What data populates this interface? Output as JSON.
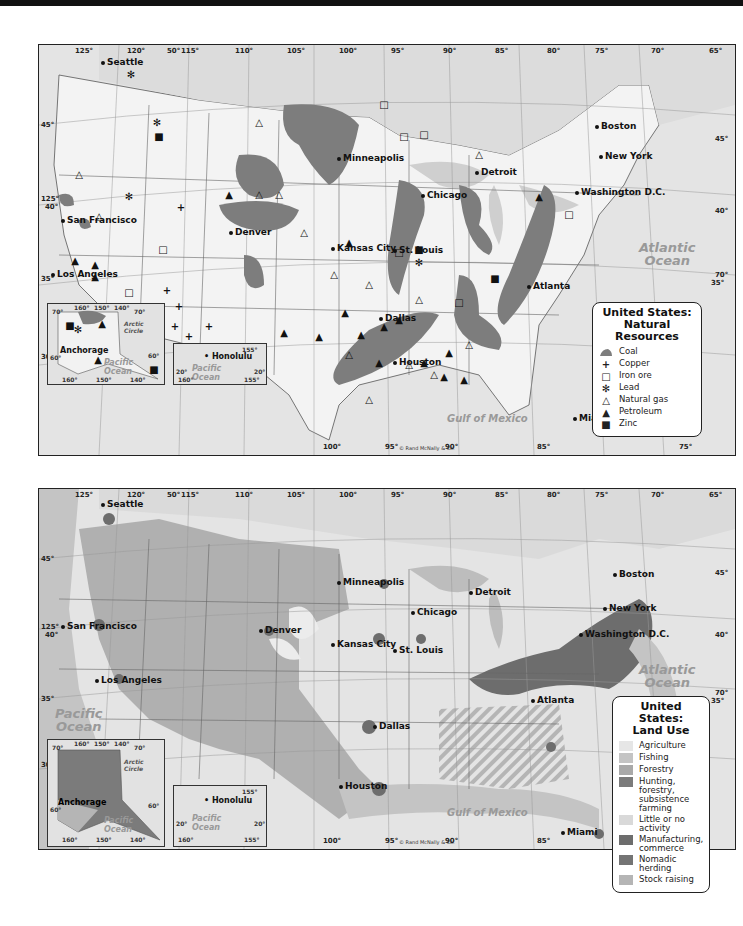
{
  "maps": [
    {
      "id": "natural-resources",
      "legend": {
        "title_line1": "United States:",
        "title_line2": "Natural Resources",
        "items": [
          {
            "symbol": "coal-shape",
            "label": "Coal"
          },
          {
            "symbol": "+",
            "label": "Copper"
          },
          {
            "symbol": "□",
            "label": "Iron ore"
          },
          {
            "symbol": "✻",
            "label": "Lead"
          },
          {
            "symbol": "△",
            "label": "Natural gas"
          },
          {
            "symbol": "▲",
            "label": "Petroleum"
          },
          {
            "symbol": "■",
            "label": "Zinc"
          }
        ]
      },
      "colors": {
        "coal": "#7d7d7d",
        "land": "#f0f0f0",
        "water": "#d3d3d3"
      }
    },
    {
      "id": "land-use",
      "legend": {
        "title_line1": "United States:",
        "title_line2": "Land Use",
        "items": [
          {
            "label": "Agriculture",
            "color": "#e6e6e6"
          },
          {
            "label": "Fishing",
            "color": "#c4c4c4"
          },
          {
            "label": "Forestry",
            "color": "#a9a9a9"
          },
          {
            "label": "Hunting, forestry, subsistence farming",
            "color": "#7b7b7b"
          },
          {
            "label": "Little or no activity",
            "color": "#d9d9d9"
          },
          {
            "label": "Manufacturing, commerce",
            "color": "#6d6d6d"
          },
          {
            "label": "Nomadic herding",
            "color": "#747474"
          },
          {
            "label": "Stock raising",
            "color": "#b5b5b5"
          }
        ]
      }
    }
  ],
  "longitude_labels": [
    "125°",
    "120°",
    "115°",
    "110°",
    "105°",
    "100°",
    "95°",
    "90°",
    "85°",
    "80°",
    "75°",
    "70°",
    "65°"
  ],
  "bottom_longitudes": [
    "100°",
    "95°",
    "90°",
    "85°",
    "75°"
  ],
  "latitude_labels": [
    "45°",
    "40°",
    "35°",
    "30°"
  ],
  "extra_labels": {
    "lat50": "50°",
    "lon125": "125°",
    "lat40r": "40°",
    "lon70r": "70°",
    "lat35r": "35°",
    "lat45r": "45°"
  },
  "cities": [
    "Seattle",
    "San Francisco",
    "Los Angeles",
    "Denver",
    "Minneapolis",
    "Kansas City",
    "St. Louis",
    "Chicago",
    "Detroit",
    "Dallas",
    "Houston",
    "Atlanta",
    "Miami",
    "Boston",
    "New York",
    "Washington D.C."
  ],
  "oceans": {
    "pacific_line1": "Pacific",
    "pacific_line2": "Ocean",
    "atlantic_line1": "Atlantic",
    "atlantic_line2": "Ocean",
    "gulf": "Gulf of Mexico"
  },
  "credit": "© Rand McNally & Co.",
  "alaska_inset": {
    "city": "Anchorage",
    "arctic": "Arctic Circle",
    "lon_top": [
      "160°",
      "150°",
      "140°"
    ],
    "lat_top": [
      "70°",
      "70°"
    ],
    "lon_bottom": [
      "160°",
      "150°",
      "140°"
    ],
    "lat_side": [
      "60°",
      "60°"
    ],
    "ocean_line1": "Pacific",
    "ocean_line2": "Ocean"
  },
  "hawaii_inset": {
    "city": "Honolulu",
    "lon_top": "155°",
    "lat": [
      "20°",
      "20°"
    ],
    "lon_bottom": [
      "160°",
      "155°"
    ],
    "ocean_line1": "Pacific",
    "ocean_line2": "Ocean"
  }
}
